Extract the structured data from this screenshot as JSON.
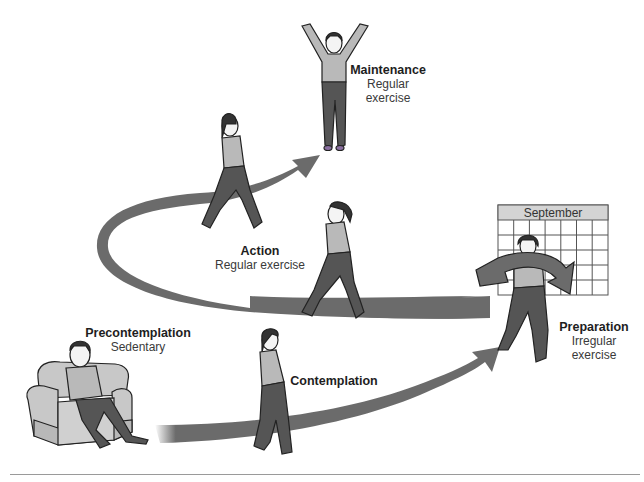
{
  "diagram": {
    "type": "stages-of-change",
    "colors": {
      "arrow": "#6b6b6b",
      "arrow_dark": "#5a5a5a",
      "shirt": "#b9b9b9",
      "pants": "#555555",
      "outline": "#222222",
      "chair": "#c8c8c8",
      "calendar_header": "#d4d4d4",
      "shoe_accent": "#8a6fa0",
      "rule": "#9a9a9a"
    },
    "stages": [
      {
        "id": "precontemplation",
        "title": "Precontemplation",
        "desc": "Sedentary"
      },
      {
        "id": "contemplation",
        "title": "Contemplation",
        "desc": ""
      },
      {
        "id": "preparation",
        "title": "Preparation",
        "desc_line1": "Irregular",
        "desc_line2": "exercise"
      },
      {
        "id": "action",
        "title": "Action",
        "desc": "Regular exercise"
      },
      {
        "id": "maintenance",
        "title": "Maintenance",
        "desc_line1": "Regular",
        "desc_line2": "exercise"
      }
    ],
    "calendar": {
      "month": "September",
      "columns": 7,
      "rows": 5
    }
  }
}
